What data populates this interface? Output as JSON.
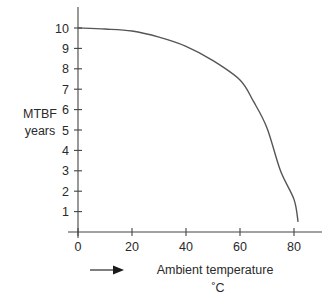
{
  "chart_data": {
    "type": "line",
    "title": "",
    "xlabel": "Ambient temperature",
    "xlabel_unit": "˚C",
    "ylabel": "MTBF",
    "ylabel_unit": "years",
    "xlim": [
      0,
      90
    ],
    "ylim": [
      0,
      11
    ],
    "x_ticks": [
      0,
      20,
      40,
      60,
      80
    ],
    "y_ticks": [
      1,
      2,
      3,
      4,
      5,
      6,
      7,
      8,
      9,
      10
    ],
    "grid": false,
    "legend": null,
    "annotations": [
      {
        "type": "arrow",
        "direction": "right",
        "position": "below x-axis, left of x label"
      }
    ],
    "series": [
      {
        "name": "MTBF vs ambient temperature",
        "x": [
          0,
          10,
          20,
          30,
          40,
          50,
          60,
          65,
          70,
          75,
          80,
          81.5
        ],
        "y": [
          10.0,
          9.95,
          9.85,
          9.55,
          9.1,
          8.4,
          7.45,
          6.4,
          5.1,
          3.0,
          1.6,
          0.5
        ]
      }
    ]
  },
  "labels": {
    "y_title_line1": "MTBF",
    "y_title_line2": "years",
    "x_title_line1": "Ambient temperature",
    "x_title_line2": "˚C"
  },
  "colors": {
    "axis": "#444444",
    "curve": "#555555",
    "text": "#2a2a2a",
    "background": "#ffffff"
  }
}
